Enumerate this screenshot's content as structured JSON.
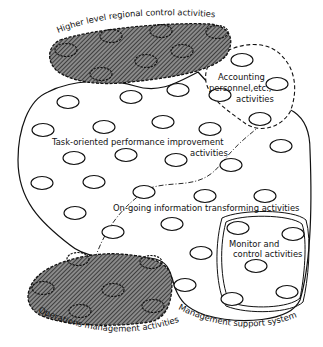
{
  "diagram": {
    "title": "",
    "regions": {
      "higher_level": {
        "label": "Higher level regional control activities",
        "style": "hatched, dashed border"
      },
      "accounting": {
        "label_line1": "Accounting",
        "label_line2": "personnel,etc.,",
        "label_line3": "activities",
        "style": "dashed border"
      },
      "task_oriented": {
        "label_line1": "Task-oriented performance improvement",
        "label_line2": "activities",
        "style": "solid border (part of management support system)"
      },
      "ongoing": {
        "label": "On-going information transforming activities",
        "style": "dash-dot divider"
      },
      "monitor": {
        "label_line1": "Monitor and",
        "label_line2": "control activities",
        "style": "double solid border"
      },
      "operations": {
        "label": "Operations management activities",
        "style": "hatched, dashed border"
      },
      "management_support": {
        "label": "Management support system",
        "style": "solid outer border"
      }
    },
    "colors": {
      "ink": "#111111",
      "hatch_fill": "#555555",
      "background": "#ffffff"
    },
    "node_count": 46
  }
}
